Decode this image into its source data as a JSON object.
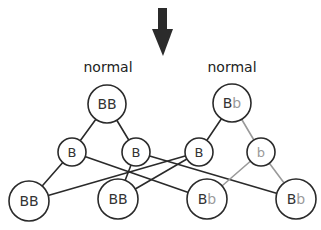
{
  "colors": {
    "dominant": "#333333",
    "recessive": "#9a9a9a",
    "stroke": "#2a2a2a",
    "gray_line": "#9a9a9a",
    "arrow": "#2b2b2b"
  },
  "arrow": {
    "icon": "down-arrow-icon"
  },
  "labels": {
    "left_parent": "normal",
    "right_parent": "normal"
  },
  "parents": [
    {
      "id": "p1",
      "genotype": [
        "B",
        "B"
      ],
      "label": "normal"
    },
    {
      "id": "p2",
      "genotype": [
        "B",
        "b"
      ],
      "label": "normal"
    }
  ],
  "gametes": [
    {
      "id": "g1",
      "allele": "B",
      "parent": "p1"
    },
    {
      "id": "g2",
      "allele": "B",
      "parent": "p1"
    },
    {
      "id": "g3",
      "allele": "B",
      "parent": "p2"
    },
    {
      "id": "g4",
      "allele": "b",
      "parent": "p2"
    }
  ],
  "offspring": [
    {
      "id": "o1",
      "genotype": [
        "B",
        "B"
      ]
    },
    {
      "id": "o2",
      "genotype": [
        "B",
        "B"
      ]
    },
    {
      "id": "o3",
      "genotype": [
        "B",
        "b"
      ]
    },
    {
      "id": "o4",
      "genotype": [
        "B",
        "b"
      ]
    }
  ],
  "text": {
    "p1_a1": "B",
    "p1_a2": "B",
    "p2_a1": "B",
    "p2_a2": "b",
    "g1": "B",
    "g2": "B",
    "g3": "B",
    "g4": "b",
    "o1_a1": "B",
    "o1_a2": "B",
    "o2_a1": "B",
    "o2_a2": "B",
    "o3_a1": "B",
    "o3_a2": "b",
    "o4_a1": "B",
    "o4_a2": "b"
  }
}
